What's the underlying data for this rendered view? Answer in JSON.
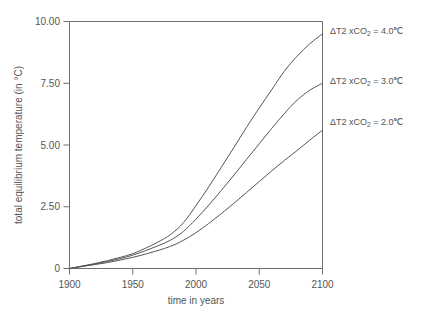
{
  "chart_data": {
    "type": "line",
    "title": "",
    "xlabel": "time in years",
    "ylabel": "total equilibrium temperature (in °C)",
    "xlim": [
      1900,
      2100
    ],
    "ylim": [
      0,
      10
    ],
    "grid": false,
    "legend_position": "right-of-plot-inline-annotations",
    "xticks": [
      "1900",
      "1950",
      "2000",
      "2050",
      "2100"
    ],
    "xtick_values": [
      1900,
      1950,
      2000,
      2050,
      2100
    ],
    "yticks": [
      "0",
      "2.50",
      "5.00",
      "7.50",
      "10.00"
    ],
    "ytick_values": [
      0,
      2.5,
      5.0,
      7.5,
      10.0
    ],
    "x": [
      1900,
      1910,
      1920,
      1930,
      1940,
      1950,
      1960,
      1970,
      1980,
      1990,
      2000,
      2010,
      2020,
      2030,
      2040,
      2050,
      2060,
      2070,
      2080,
      2090,
      2100
    ],
    "series": [
      {
        "name": "ΔT2 xCO₂ = 4.0℃",
        "sensitivity": 4.0,
        "color": "#555555",
        "values": [
          0.0,
          0.1,
          0.2,
          0.32,
          0.45,
          0.6,
          0.82,
          1.07,
          1.38,
          1.85,
          2.55,
          3.3,
          4.1,
          4.9,
          5.72,
          6.5,
          7.25,
          8.0,
          8.6,
          9.1,
          9.5
        ],
        "end_value": 9.5
      },
      {
        "name": "ΔT2 xCO₂ = 3.0℃",
        "sensitivity": 3.0,
        "color": "#555555",
        "values": [
          0.0,
          0.09,
          0.18,
          0.28,
          0.4,
          0.54,
          0.72,
          0.92,
          1.15,
          1.5,
          2.0,
          2.56,
          3.16,
          3.78,
          4.42,
          5.05,
          5.68,
          6.28,
          6.82,
          7.22,
          7.5
        ],
        "end_value": 7.5
      },
      {
        "name": "ΔT2 xCO₂ = 2.0℃",
        "sensitivity": 2.0,
        "color": "#555555",
        "values": [
          0.0,
          0.08,
          0.16,
          0.24,
          0.34,
          0.45,
          0.58,
          0.73,
          0.9,
          1.14,
          1.45,
          1.82,
          2.22,
          2.64,
          3.08,
          3.52,
          3.96,
          4.38,
          4.78,
          5.2,
          5.6
        ],
        "end_value": 5.6
      }
    ],
    "annotations": [
      {
        "prefix": "ΔT2 xCO",
        "sub": "2",
        "text_after": " = 4.0℃",
        "full": "ΔT2 xCO₂ = 4.0℃",
        "value": 4.0
      },
      {
        "prefix": "ΔT2 xCO",
        "sub": "2",
        "text_after": " = 3.0℃",
        "full": "ΔT2 xCO₂ = 3.0℃",
        "value": 3.0
      },
      {
        "prefix": "ΔT2 xCO",
        "sub": "2",
        "text_after": " = 2.0℃",
        "full": "ΔT2 xCO₂ = 2.0℃",
        "value": 2.0
      }
    ],
    "colors": {
      "background": "#ffffff",
      "axis": "#6e6e6e",
      "line": "#555555",
      "text": "#555555"
    }
  }
}
